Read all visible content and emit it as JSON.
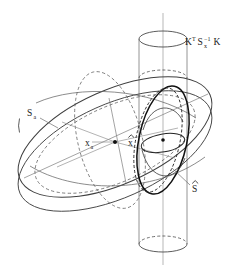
{
  "figure": {
    "background_color": "#ffffff",
    "stroke_color": "#4a4a4a",
    "stroke_color_dark": "#111111",
    "stroke_color_light": "#8c8c8c",
    "width": 241,
    "height": 276
  },
  "labels": {
    "cylinder": {
      "name": "K-transpose-Sx-inverse-K",
      "base1": "K",
      "sup1": "T",
      "base2": "S",
      "sub2": "x",
      "sup2": "−1",
      "base3": "K",
      "plain": "Kᵀ Sₓ⁻¹ K",
      "x": 185,
      "y": 45
    },
    "prior_ellipsoid": {
      "name": "S-a",
      "base": "S",
      "sub": "a",
      "plain": "Sₐ",
      "x": 27,
      "y": 116
    },
    "prior_point": {
      "name": "x-a",
      "base": "x",
      "sub": "a",
      "plain": "xₐ",
      "x": 85,
      "y": 146
    },
    "estimate_point": {
      "name": "x-hat",
      "base": "x",
      "accent": "hat",
      "plain": "x̂",
      "x": 128,
      "y": 144
    },
    "posterior_ellipsoid": {
      "name": "S-hat",
      "base": "S",
      "accent": "hat",
      "plain": "Ŝ",
      "x": 192,
      "y": 190
    }
  },
  "elements": {
    "big_ellipsoid": "prior covariance ellipsoid S_a",
    "cylinder": "measurement constraint cylinder K^T Sx^-1 K",
    "small_ellipsoid": "posterior covariance ellipsoid S-hat",
    "center_dot_prior": "x_a marker dot",
    "center_dot_estimate": "x-hat marker dot",
    "vertical_axis": "cylinder central axis"
  }
}
